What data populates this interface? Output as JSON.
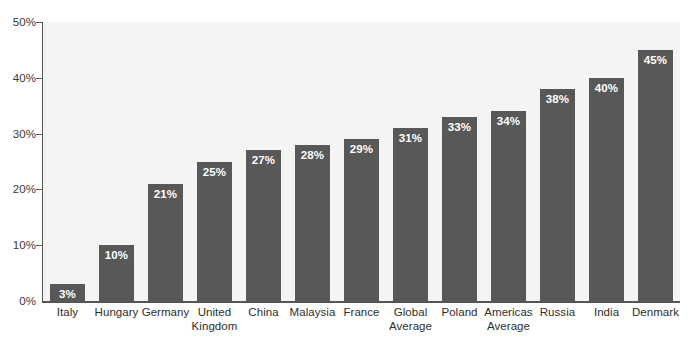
{
  "chart_data": {
    "type": "bar",
    "title": "",
    "subtitle": "",
    "xlabel": "",
    "ylabel": "",
    "ylim": [
      0,
      50
    ],
    "grid": false,
    "legend": null,
    "orientation": "vertical",
    "bar_color": "#585858",
    "plot_background": "#f4f4f2",
    "axis_color": "#555555",
    "value_label_color": "#ffffff",
    "category_label_color": "#2e2e2e",
    "y_ticks": [
      {
        "value": 50,
        "label": "50%"
      },
      {
        "value": 40,
        "label": "40%"
      },
      {
        "value": 30,
        "label": "30%"
      },
      {
        "value": 20,
        "label": "20%"
      },
      {
        "value": 10,
        "label": "10%"
      },
      {
        "value": 0,
        "label": "0%"
      }
    ],
    "categories": [
      "Italy",
      "Hungary",
      "Germany",
      "United Kingdom",
      "China",
      "Malaysia",
      "France",
      "Global Average",
      "Poland",
      "Americas Average",
      "Russia",
      "India",
      "Denmark"
    ],
    "category_lines": [
      [
        "Italy"
      ],
      [
        "Hungary"
      ],
      [
        "Germany"
      ],
      [
        "United",
        "Kingdom"
      ],
      [
        "China"
      ],
      [
        "Malaysia"
      ],
      [
        "France"
      ],
      [
        "Global",
        "Average"
      ],
      [
        "Poland"
      ],
      [
        "Americas",
        "Average"
      ],
      [
        "Russia"
      ],
      [
        "India"
      ],
      [
        "Denmark"
      ]
    ],
    "values": [
      3,
      10,
      21,
      25,
      27,
      28,
      29,
      31,
      33,
      34,
      38,
      40,
      45
    ],
    "value_labels": [
      "3%",
      "10%",
      "21%",
      "25%",
      "27%",
      "28%",
      "29%",
      "31%",
      "33%",
      "34%",
      "38%",
      "40%",
      "45%"
    ]
  }
}
